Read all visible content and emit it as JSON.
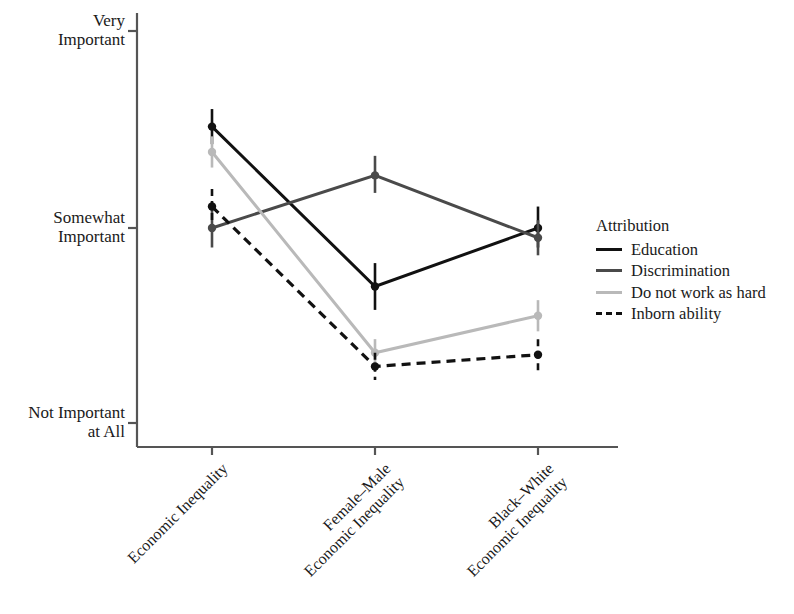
{
  "chart_data": {
    "type": "line",
    "title": "",
    "xlabel": "",
    "ylabel": "",
    "categories": [
      "Economic Inequality",
      "Female–Male\nEconomic Inequality",
      "Black–White\nEconomic Inequality"
    ],
    "category_lines": [
      [
        "Economic Inequality"
      ],
      [
        "Female–Male",
        "Economic Inequality"
      ],
      [
        "Black–White",
        "Economic Inequality"
      ]
    ],
    "ytick_labels": [
      "Very\nImportant",
      "Somewhat\nImportant",
      "Not Important\nat All"
    ],
    "ytick_lines": [
      [
        "Very",
        "Important"
      ],
      [
        "Somewhat",
        "Important"
      ],
      [
        "Not Important",
        "at All"
      ]
    ],
    "ytick_values": [
      3,
      2,
      1
    ],
    "ylim": [
      0.88,
      3.08
    ],
    "grid": false,
    "legend_title": "Attribution",
    "legend_position": "right",
    "series": [
      {
        "name": "Education",
        "color": "#111111",
        "style": "solid",
        "values": [
          2.52,
          1.7,
          2.0
        ],
        "err_low": [
          2.43,
          1.58,
          1.9
        ],
        "err_high": [
          2.61,
          1.82,
          2.11
        ]
      },
      {
        "name": "Discrimination",
        "color": "#4a4a4a",
        "style": "solid",
        "values": [
          2.0,
          2.27,
          1.95
        ],
        "err_low": [
          1.9,
          2.18,
          1.86
        ],
        "err_high": [
          2.1,
          2.37,
          2.04
        ]
      },
      {
        "name": "Do not work as hard",
        "color": "#b9b9b9",
        "style": "solid",
        "values": [
          2.39,
          1.36,
          1.55
        ],
        "err_low": [
          2.31,
          1.3,
          1.47
        ],
        "err_high": [
          2.47,
          1.43,
          1.63
        ]
      },
      {
        "name": "Inborn ability",
        "color": "#111111",
        "style": "dashed",
        "values": [
          2.11,
          1.29,
          1.35
        ],
        "err_low": [
          2.02,
          1.22,
          1.27
        ],
        "err_high": [
          2.2,
          1.36,
          1.43
        ]
      }
    ]
  },
  "axes": {
    "y_axis_name": "importance-scale",
    "x_axis_name": "inequality-type"
  }
}
